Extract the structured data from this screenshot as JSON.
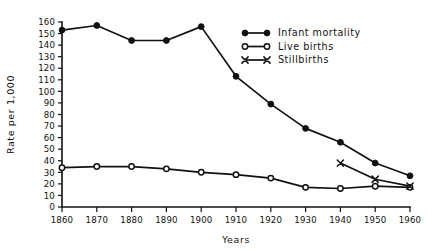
{
  "chart_data": {
    "type": "line",
    "title": "",
    "xlabel": "Years",
    "ylabel": "Rate per 1,000",
    "x": [
      1860,
      1870,
      1880,
      1890,
      1900,
      1910,
      1920,
      1930,
      1940,
      1950,
      1960
    ],
    "categories": [
      "1860",
      "1870",
      "1880",
      "1890",
      "1900",
      "1910",
      "1920",
      "1930",
      "1940",
      "1950",
      "1960"
    ],
    "xlim": [
      1860,
      1960
    ],
    "ylim": [
      0,
      160
    ],
    "ytick_step": 10,
    "yticks": [
      0,
      10,
      20,
      30,
      40,
      50,
      60,
      70,
      80,
      90,
      100,
      110,
      120,
      130,
      140,
      150,
      160
    ],
    "ytick_labels": [
      "0",
      "10",
      "20",
      "30",
      "40",
      "50",
      "60",
      "70",
      "80",
      "90",
      "100",
      "110",
      "120",
      "130",
      "140",
      "150",
      "160"
    ],
    "xtick_labels": [
      "1860",
      "1870",
      "1880",
      "1890",
      "1900",
      "1910",
      "1920",
      "1930",
      "1940",
      "1950",
      "1960"
    ],
    "grid": false,
    "legend_position": "top-right",
    "series": [
      {
        "name": "Infant mortality",
        "marker": "filled-circle",
        "x": [
          1860,
          1870,
          1880,
          1890,
          1900,
          1910,
          1920,
          1930,
          1940,
          1950,
          1960
        ],
        "values": [
          153,
          157,
          144,
          144,
          156,
          113,
          89,
          68,
          56,
          38,
          27
        ]
      },
      {
        "name": "Live births",
        "marker": "open-circle",
        "x": [
          1860,
          1870,
          1880,
          1890,
          1900,
          1910,
          1920,
          1930,
          1940,
          1950,
          1960
        ],
        "values": [
          34,
          35,
          35,
          33,
          30,
          28,
          25,
          17,
          16,
          18,
          17
        ]
      },
      {
        "name": "Stillbirths",
        "marker": "cross-x",
        "x": [
          1940,
          1950,
          1960
        ],
        "values": [
          38,
          24,
          18
        ]
      }
    ]
  },
  "legend": {
    "items": [
      {
        "label": "Infant mortality",
        "marker": "filled-circle"
      },
      {
        "label": "Live births",
        "marker": "open-circle"
      },
      {
        "label": "Stillbirths",
        "marker": "cross-x"
      }
    ]
  },
  "axes": {
    "y_axis_title": "Rate per 1,000",
    "x_axis_title": "Years"
  },
  "colors": {
    "ink": "#111111",
    "paper": "#ffffff"
  }
}
